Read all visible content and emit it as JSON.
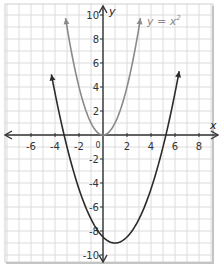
{
  "chart_data": {
    "type": "line",
    "title": "",
    "xlabel": "x",
    "ylabel": "y",
    "xlim": [
      -8,
      9
    ],
    "ylim": [
      -11,
      11
    ],
    "grid": true,
    "x_ticks": [
      -6,
      -4,
      -2,
      2,
      4,
      6,
      8
    ],
    "y_ticks": [
      -10,
      -8,
      -6,
      -4,
      -2,
      2,
      4,
      6,
      8,
      10
    ],
    "origin_label": "0",
    "series": [
      {
        "name": "y = x^2",
        "label": "y = x",
        "label_exponent": "2",
        "equation": "y = x^2",
        "color": "#8a8a8a",
        "vertex": [
          0,
          0
        ],
        "points": [
          [
            -3.16,
            10
          ],
          [
            -2,
            4
          ],
          [
            -1,
            1
          ],
          [
            0,
            0
          ],
          [
            1,
            1
          ],
          [
            2,
            4
          ],
          [
            3.16,
            10
          ]
        ]
      },
      {
        "name": "transformed parabola",
        "equation": "y = 0.5(x - 1)^2 - 9",
        "color": "#2b2b2b",
        "vertex": [
          1,
          -9
        ],
        "roots": [
          -3.24,
          5.24
        ],
        "y_intercept": -8.5,
        "points": [
          [
            -4.2,
            4.5
          ],
          [
            -3.24,
            0
          ],
          [
            -2,
            -4.5
          ],
          [
            0,
            -8.5
          ],
          [
            1,
            -9
          ],
          [
            2,
            -8.5
          ],
          [
            4,
            -4.5
          ],
          [
            5.24,
            0
          ],
          [
            6.4,
            5.6
          ]
        ]
      }
    ]
  },
  "colors": {
    "grid": "#dcdcdc",
    "axis": "#333333",
    "frame_shadow": "#c8c8c8",
    "label_gray": "#8a8a8a"
  }
}
